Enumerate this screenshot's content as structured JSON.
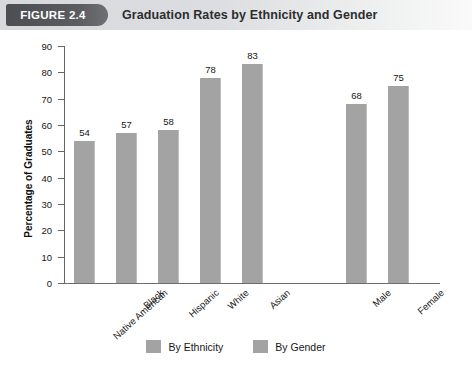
{
  "header": {
    "badge_label": "FIGURE 2.4",
    "title": "Graduation Rates by Ethnicity and Gender"
  },
  "colors": {
    "bar_fill": "#a3a3a3",
    "axis": "#666666",
    "badge_bg": "#4c4e51",
    "header_bg": "#d8d9db",
    "text": "#161616"
  },
  "chart_data": {
    "type": "bar",
    "title": "Graduation Rates by Ethnicity and Gender",
    "xlabel": "",
    "ylabel": "Percentage of Graduates",
    "ylim": [
      0,
      90
    ],
    "ytick_step": 10,
    "yticks": [
      0,
      10,
      20,
      30,
      40,
      50,
      60,
      70,
      80,
      90
    ],
    "ytick_labels": [
      "0",
      "10",
      "20",
      "30",
      "40",
      "50",
      "60",
      "70",
      "80",
      "90"
    ],
    "grid": false,
    "legend_position": "bottom",
    "data_labels": true,
    "categories": [
      "Native American",
      "Black",
      "Hispanic",
      "White",
      "Asian",
      "Male",
      "Female"
    ],
    "values": [
      54,
      57,
      58,
      78,
      83,
      68,
      75
    ],
    "groups": [
      {
        "name": "By Ethnicity",
        "categories": [
          "Native American",
          "Black",
          "Hispanic",
          "White",
          "Asian"
        ],
        "values": [
          54,
          57,
          58,
          78,
          83
        ]
      },
      {
        "name": "By Gender",
        "categories": [
          "Male",
          "Female"
        ],
        "values": [
          68,
          75
        ]
      }
    ],
    "legend": [
      {
        "label": "By Ethnicity",
        "color": "#a3a3a3"
      },
      {
        "label": "By Gender",
        "color": "#a3a3a3"
      }
    ],
    "bars": [
      {
        "category": "Native American",
        "value": 54,
        "group": "By Ethnicity",
        "value_label": "54"
      },
      {
        "category": "Black",
        "value": 57,
        "group": "By Ethnicity",
        "value_label": "57"
      },
      {
        "category": "Hispanic",
        "value": 58,
        "group": "By Ethnicity",
        "value_label": "58"
      },
      {
        "category": "White",
        "value": 78,
        "group": "By Ethnicity",
        "value_label": "78"
      },
      {
        "category": "Asian",
        "value": 83,
        "group": "By Ethnicity",
        "value_label": "83"
      },
      {
        "category": "Male",
        "value": 68,
        "group": "By Gender",
        "value_label": "68"
      },
      {
        "category": "Female",
        "value": 75,
        "group": "By Gender",
        "value_label": "75"
      }
    ]
  }
}
